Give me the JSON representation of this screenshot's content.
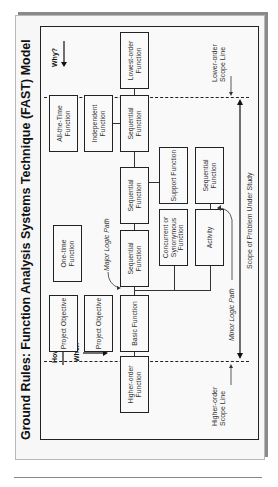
{
  "title": "Ground Rules:  Function Analysis Systems Technique (FAST) Model",
  "directions": {
    "how": "How",
    "when": "When",
    "why": "Why?"
  },
  "boxes": {
    "higher_order": "Higher-order Function",
    "project_objective_1": "Project Objective",
    "project_objective_2": "Project Objective",
    "basic": "Basic Function",
    "one_time": "One-time Function",
    "sequential_1": "Sequential Function",
    "concurrent": "Concurrent or Synonymous Function",
    "sequential_2": "Sequential Function",
    "support": "Support Function",
    "activity": "Activity",
    "sequential_minor": "Sequential Function",
    "all_the_time": "All-the-Time Function",
    "independent": "Independent Function",
    "sequential_3": "Sequential Function",
    "lowest_order": "Lowest-order Function"
  },
  "labels": {
    "major_logic_path": "Major Logic Path",
    "minor_logic_path": "Minor Logic Path",
    "scope_of_problem": "Scope of Problem Under Study",
    "higher_order_scope_line": "Higher-order Scope Line",
    "lower_order_scope_line": "Lower-order Scope Line"
  },
  "colors": {
    "line": "#222222",
    "frame_bg": "#f7f7f7",
    "shadow": "#8a8a8a"
  }
}
